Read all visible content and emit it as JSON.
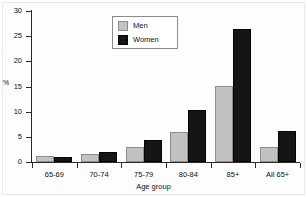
{
  "chart_data": {
    "type": "bar",
    "title": "",
    "xlabel": "Age group",
    "ylabel": "%",
    "ylim": [
      0,
      30
    ],
    "yticks": [
      0,
      5,
      10,
      15,
      20,
      25,
      30
    ],
    "ytick_labels": [
      "0",
      "5",
      "10",
      "15",
      "20",
      "25",
      "30"
    ],
    "grid": false,
    "legend_position": "top-center",
    "categories": [
      "65-69",
      "70-74",
      "75-79",
      "80-84",
      "85+",
      "All 65+"
    ],
    "series": [
      {
        "name": "Men",
        "color": "#c2c2c2",
        "values": [
          1.1,
          1.6,
          3.0,
          6.0,
          15.2,
          2.9
        ]
      },
      {
        "name": "Women",
        "color": "#151515",
        "values": [
          0.9,
          1.9,
          4.3,
          10.4,
          26.4,
          6.2
        ]
      }
    ]
  }
}
